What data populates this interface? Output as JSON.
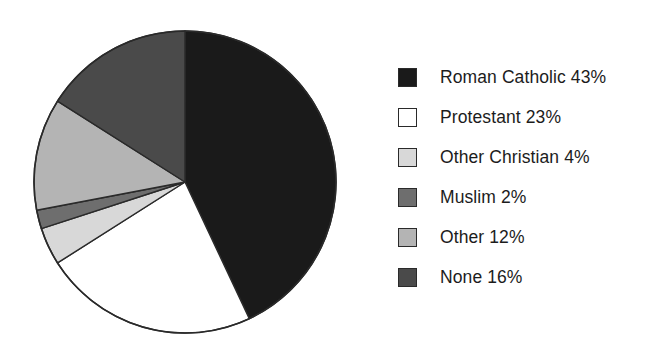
{
  "chart_data": {
    "type": "pie",
    "title": "",
    "subtitle": "",
    "xlabel": "",
    "ylabel": "",
    "grid": false,
    "legend_position": "right",
    "start_angle_deg": 0,
    "direction": "clockwise",
    "units": "percent",
    "total": 100,
    "categories": [
      "Roman Catholic",
      "Protestant",
      "Other Christian",
      "Muslim",
      "Other",
      "None"
    ],
    "values": [
      43,
      23,
      4,
      2,
      12,
      16
    ],
    "value_labels": [
      "43%",
      "23%",
      "4%",
      "2%",
      "12%",
      "16%"
    ],
    "colors": [
      "#1a1a1a",
      "#ffffff",
      "#d8d8d8",
      "#6e6e6e",
      "#b4b4b4",
      "#4a4a4a"
    ],
    "slice_border_color": "#2a2a2a",
    "slices": [
      {
        "label": "Roman Catholic",
        "value": 43,
        "value_label": "43%",
        "color": "#1a1a1a",
        "start_deg": 0.0,
        "end_deg": 154.8
      },
      {
        "label": "Protestant",
        "value": 23,
        "value_label": "23%",
        "color": "#ffffff",
        "start_deg": 154.8,
        "end_deg": 237.6
      },
      {
        "label": "Other Christian",
        "value": 4,
        "value_label": "4%",
        "color": "#d8d8d8",
        "start_deg": 237.6,
        "end_deg": 252.0
      },
      {
        "label": "Muslim",
        "value": 2,
        "value_label": "2%",
        "color": "#6e6e6e",
        "start_deg": 252.0,
        "end_deg": 259.2
      },
      {
        "label": "Other",
        "value": 12,
        "value_label": "12%",
        "color": "#b4b4b4",
        "start_deg": 259.2,
        "end_deg": 302.4
      },
      {
        "label": "None",
        "value": 16,
        "value_label": "16%",
        "color": "#4a4a4a",
        "start_deg": 302.4,
        "end_deg": 360.0
      }
    ]
  },
  "legend": {
    "items": [
      {
        "text": "Roman Catholic 43%",
        "color": "#1a1a1a"
      },
      {
        "text": "Protestant 23%",
        "color": "#ffffff"
      },
      {
        "text": "Other Christian 4%",
        "color": "#d8d8d8"
      },
      {
        "text": "Muslim 2%",
        "color": "#6e6e6e"
      },
      {
        "text": "Other 12%",
        "color": "#b4b4b4"
      },
      {
        "text": "None 16%",
        "color": "#4a4a4a"
      }
    ]
  }
}
